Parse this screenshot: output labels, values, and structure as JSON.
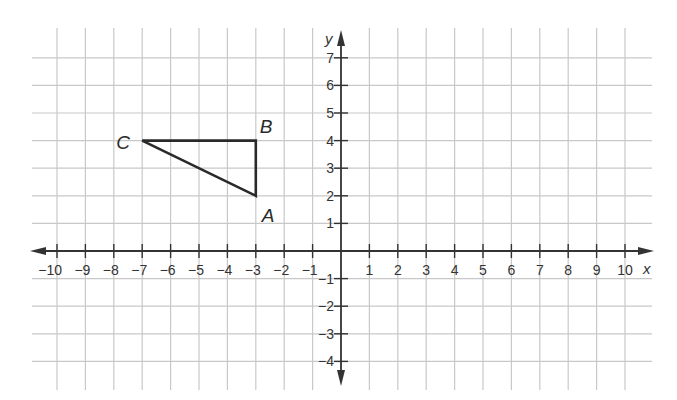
{
  "chart_data": {
    "type": "scatter",
    "title": "",
    "xlabel": "x",
    "ylabel": "y",
    "xlim": [
      -10,
      10
    ],
    "ylim": [
      -4,
      7
    ],
    "grid": true,
    "x_ticks": [
      -10,
      -9,
      -8,
      -7,
      -6,
      -5,
      -4,
      -3,
      -2,
      -1,
      1,
      2,
      3,
      4,
      5,
      6,
      7,
      8,
      9,
      10
    ],
    "y_ticks": [
      -4,
      -3,
      -2,
      -1,
      1,
      2,
      3,
      4,
      5,
      6,
      7
    ],
    "shapes": [
      {
        "name": "triangle ABC",
        "vertices": [
          {
            "label": "A",
            "x": -3,
            "y": 2
          },
          {
            "label": "B",
            "x": -3,
            "y": 4
          },
          {
            "label": "C",
            "x": -7,
            "y": 4
          }
        ]
      }
    ]
  },
  "axes": {
    "x_label": "x",
    "y_label": "y"
  },
  "colors": {
    "grid": "#c8c8c8",
    "axis": "#333333",
    "shape": "#2a2a2a"
  }
}
